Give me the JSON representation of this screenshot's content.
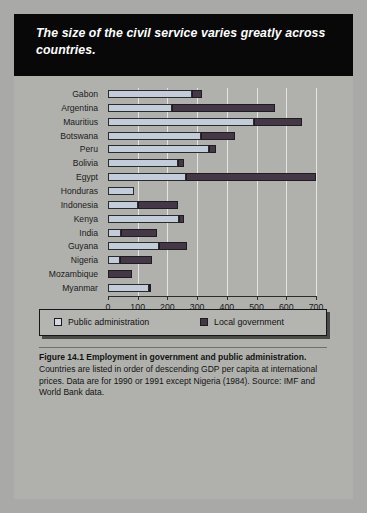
{
  "figure": {
    "banner_title": "The size of the civil service varies greatly across countries.",
    "caption_bold": "Figure 14.1  Employment in government and public administration.",
    "caption_rest": " Countries are listed in order of descending GDP per capita at international prices. Data are for 1990 or 1991 except Nigeria (1984). Source: IMF and World Bank data."
  },
  "legend": {
    "public_label": "Public administration",
    "local_label": "Local government",
    "public_color": "#d2d8e4",
    "local_color": "#443846"
  },
  "chart_data": {
    "type": "bar",
    "orientation": "horizontal",
    "stacked": true,
    "title": "The size of the civil service varies greatly across countries.",
    "xlabel": "Workers per 10,000 population",
    "ylabel": "",
    "xlim": [
      0,
      700
    ],
    "xticks": [
      0,
      100,
      200,
      300,
      400,
      500,
      600,
      700
    ],
    "xticklabels": [
      "0",
      "100",
      "200",
      "300",
      "400",
      "500",
      "600",
      "700"
    ],
    "grid": "vertical",
    "legend_position": "below-plot",
    "categories": [
      "Gabon",
      "Argentina",
      "Mauritius",
      "Botswana",
      "Peru",
      "Bolivia",
      "Egypt",
      "Honduras",
      "Indonesia",
      "Kenya",
      "India",
      "Guyana",
      "Nigeria",
      "Mozambique",
      "Myanmar"
    ],
    "series": [
      {
        "name": "Public administration",
        "color": "#c3ccdb",
        "values": [
          282,
          216,
          491,
          313,
          340,
          234,
          262,
          87,
          101,
          240,
          45,
          172,
          41,
          0,
          137
        ]
      },
      {
        "name": "Local government",
        "color": "#443846",
        "values": [
          34,
          347,
          162,
          113,
          25,
          22,
          438,
          0,
          133,
          16,
          120,
          93,
          106,
          82,
          8
        ]
      }
    ],
    "totals": [
      316,
      563,
      653,
      426,
      365,
      256,
      700,
      87,
      234,
      256,
      165,
      265,
      147,
      82,
      145
    ]
  }
}
